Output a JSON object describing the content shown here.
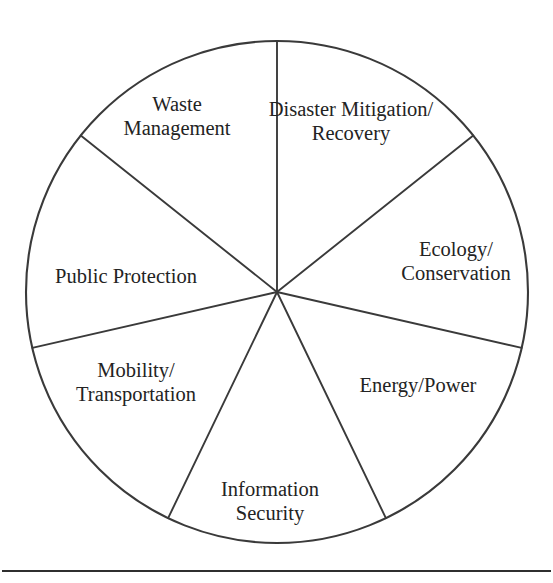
{
  "figure": {
    "title_cut_off": "- - - - - - - -",
    "background_color": "#ffffff",
    "line_color": "#3a3a3a",
    "text_color": "#232323"
  },
  "chart_data": {
    "type": "pie",
    "title": "",
    "subtitle": "",
    "xlabel": "",
    "ylabel": "",
    "legend_position": "none",
    "grid": false,
    "equal_slices": true,
    "slice_count": 7,
    "slice_angle_degrees": 51.43,
    "categories": [
      "Disaster Mitigation/ Recovery",
      "Ecology/ Conservation",
      "Energy/Power",
      "Information Security",
      "Mobility/ Transportation",
      "Public Protection",
      "Waste Management"
    ],
    "values": [
      14.29,
      14.29,
      14.29,
      14.29,
      14.29,
      14.29,
      14.29
    ],
    "geometry": {
      "center_x": 277,
      "center_y": 292,
      "radius": 251,
      "start_angle_degrees": 90
    },
    "slices": [
      {
        "index": 0,
        "label": "Disaster Mitigation/\nRecovery",
        "label_lines": [
          "Disaster",
          "Mitigation/",
          "Recovery"
        ],
        "start_angle": 90,
        "end_angle": 38.57,
        "label_x": 351,
        "label_y": 122
      },
      {
        "index": 1,
        "label": "Ecology/\nConservation",
        "label_lines": [
          "Ecology/",
          "Conservation"
        ],
        "start_angle": 38.57,
        "end_angle": -12.86,
        "label_x": 456,
        "label_y": 262
      },
      {
        "index": 2,
        "label": "Energy/Power",
        "label_lines": [
          "Energy/Power"
        ],
        "start_angle": -12.86,
        "end_angle": -64.29,
        "label_x": 418,
        "label_y": 386
      },
      {
        "index": 3,
        "label": "Information\nSecurity",
        "label_lines": [
          "Information",
          "Security"
        ],
        "start_angle": -64.29,
        "end_angle": -115.71,
        "label_x": 270,
        "label_y": 502
      },
      {
        "index": 4,
        "label": "Mobility/\nTransportation",
        "label_lines": [
          "Mobility/",
          "Transportation"
        ],
        "start_angle": -115.71,
        "end_angle": -167.14,
        "label_x": 136,
        "label_y": 383
      },
      {
        "index": 5,
        "label": "Public Protection",
        "label_lines": [
          "Public Protection"
        ],
        "start_angle": -167.14,
        "end_angle": 141.43,
        "label_x": 126,
        "label_y": 277
      },
      {
        "index": 6,
        "label": "Waste\nManagement",
        "label_lines": [
          "Waste",
          "Management"
        ],
        "start_angle": 141.43,
        "end_angle": 90,
        "label_x": 177,
        "label_y": 117
      }
    ]
  },
  "footer": {
    "rule_y": 571
  }
}
